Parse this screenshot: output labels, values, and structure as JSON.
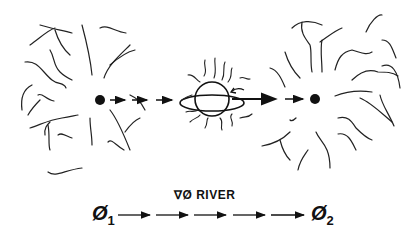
{
  "diagram": {
    "title": "∇Ø RIVER",
    "nodes": [
      {
        "id": "source",
        "label": "Ø",
        "subscript": "1",
        "type": "point-field",
        "color": "#111111"
      },
      {
        "id": "body",
        "type": "ringed-sphere",
        "label": ""
      },
      {
        "id": "sink",
        "label": "Ø",
        "subscript": "2",
        "type": "point-field",
        "color": "#111111"
      }
    ],
    "edges": [
      {
        "from": "source",
        "to": "body",
        "style": "dashed-arrows"
      },
      {
        "from": "body",
        "to": "sink",
        "style": "large-arrow"
      }
    ],
    "bottom_row": {
      "left_label": "Ø",
      "left_sub": "1",
      "river_label": "∇Ø RIVER",
      "right_label": "Ø",
      "right_sub": "2",
      "arrow_count": 5
    },
    "colors": {
      "ink": "#111111",
      "background": "#ffffff"
    }
  }
}
